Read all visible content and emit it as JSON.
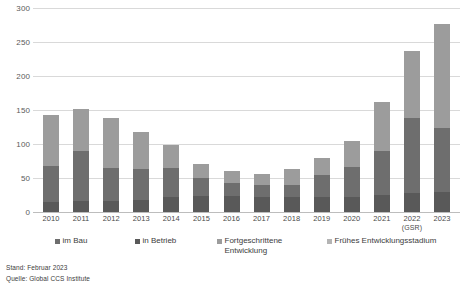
{
  "chart_data": {
    "type": "bar",
    "stacked": true,
    "title": "",
    "xlabel": "",
    "ylabel": "",
    "ylim": [
      0,
      300
    ],
    "yticks": [
      0,
      50,
      100,
      150,
      200,
      250,
      300
    ],
    "grid": true,
    "legend_position": "bottom",
    "categories": [
      "2010",
      "2011",
      "2012",
      "2013",
      "2014",
      "2015",
      "2016",
      "2017",
      "2018",
      "2019",
      "2020",
      "2021",
      "2022",
      "2023"
    ],
    "category_sublabels": [
      "",
      "",
      "",
      "",
      "",
      "",
      "",
      "",
      "",
      "",
      "",
      "",
      "(GSR)",
      ""
    ],
    "series": [
      {
        "name": "in Betrieb",
        "color": "#595959",
        "values": [
          14,
          16,
          16,
          18,
          22,
          24,
          24,
          22,
          22,
          22,
          22,
          25,
          28,
          30
        ]
      },
      {
        "name": "im Bau",
        "color": "#6e6e6e",
        "values": [
          53,
          74,
          49,
          45,
          43,
          26,
          18,
          18,
          18,
          33,
          44,
          65,
          110,
          93
        ]
      },
      {
        "name": "Fortgeschrittene Entwicklung",
        "color": "#9c9c9c",
        "values": [
          75,
          62,
          73,
          54,
          33,
          20,
          18,
          16,
          24,
          25,
          39,
          72,
          99,
          154
        ]
      },
      {
        "name": "Frühes Entwicklungsstadium",
        "color": "#b4b4b4",
        "values": [
          0,
          0,
          0,
          0,
          0,
          0,
          0,
          0,
          0,
          0,
          0,
          0,
          0,
          0
        ]
      }
    ],
    "totals": [
      142,
      152,
      138,
      117,
      98,
      70,
      60,
      56,
      64,
      80,
      105,
      162,
      237,
      277
    ]
  },
  "legend": {
    "items": [
      {
        "label": "im Bau",
        "color": "#6e6e6e"
      },
      {
        "label": "in Betrieb",
        "color": "#595959"
      },
      {
        "label": "Fortgeschrittene Entwicklung",
        "color": "#9c9c9c"
      },
      {
        "label": "Frühes Entwicklungsstadium",
        "color": "#b4b4b4"
      }
    ]
  },
  "footnotes": {
    "date": "Stand: Februar 2023",
    "source": "Quelle: Global CCS Institute"
  }
}
